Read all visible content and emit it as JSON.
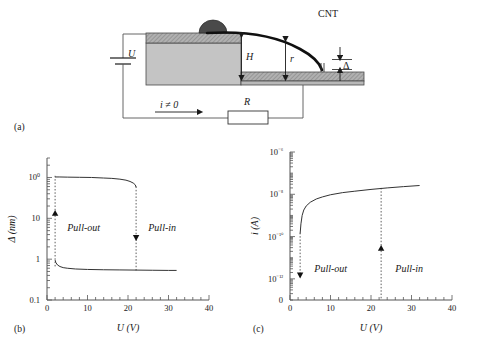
{
  "figure": {
    "panels": [
      {
        "id": "a",
        "label": "(a)"
      },
      {
        "id": "b",
        "label": "(b)"
      },
      {
        "id": "c",
        "label": "(c)"
      }
    ]
  },
  "schematic": {
    "panel_label": "(a)",
    "cnt_label": "CNT",
    "voltage_label": "U",
    "height_label": "H",
    "radius_label": "r",
    "gap_label": "Δ",
    "resistor_label": "R",
    "current_label": "i ≠ 0",
    "colors": {
      "block_body": "#c4c4c4",
      "block_top": "#a8a8a8",
      "substrate": "#b8b8b8",
      "catalyst": "#4a4a4a",
      "cnt": "#101010",
      "wire": "#555555"
    }
  },
  "chart_data": [
    {
      "type": "line",
      "panel": "b",
      "title": "",
      "xlabel": "U (V)",
      "ylabel": "Δ (nm)",
      "xlim": [
        0,
        40
      ],
      "ylim": [
        0.1,
        300
      ],
      "yscale": "log",
      "xscale": "linear",
      "xticks": [
        0,
        10,
        20,
        30,
        40
      ],
      "xticklabels": [
        "0",
        "10",
        "20",
        "30",
        "40"
      ],
      "xminor_step": 2,
      "yticks": [
        0.1,
        1,
        10,
        100
      ],
      "yticklabels": [
        "0.1",
        "1",
        "10",
        "100"
      ],
      "grid": false,
      "legend": null,
      "annotations": [
        {
          "text": "Pull-out",
          "x": 5.0,
          "y": 5.0,
          "style": "italic"
        },
        {
          "text": "Pull-in",
          "x": 25.0,
          "y": 5.0,
          "style": "italic"
        }
      ],
      "transition_lines": [
        {
          "x": 2.0,
          "y_from": 0.62,
          "y_to": 110,
          "arrow": "up",
          "arrow_y": 15,
          "name": "pull-out"
        },
        {
          "x": 22.0,
          "y_from": 60,
          "y_to": 0.5,
          "arrow": "down",
          "arrow_y": 3.0,
          "name": "pull-in"
        }
      ],
      "series": [
        {
          "name": "upper-branch",
          "comment": "separated (out) state: Δ large, from U=2 to U=22 then pull-in drop",
          "x": [
            2.0,
            3.0,
            5.0,
            8.0,
            11.0,
            14.0,
            16.0,
            18.0,
            19.5,
            20.5,
            21.3,
            21.8,
            22.0
          ],
          "y": [
            103,
            103,
            102,
            101,
            100,
            97,
            95,
            91,
            86,
            80,
            73,
            66,
            58
          ]
        },
        {
          "name": "lower-branch",
          "comment": "contacted (in) state: Δ small, from U=2 out to U=32",
          "x": [
            2.0,
            2.2,
            2.6,
            3.2,
            4.0,
            5.0,
            7.0,
            10.0,
            14.0,
            18.0,
            22.0,
            26.0,
            30.0,
            32.0
          ],
          "y": [
            0.95,
            0.82,
            0.72,
            0.66,
            0.62,
            0.6,
            0.575,
            0.56,
            0.55,
            0.545,
            0.54,
            0.535,
            0.53,
            0.53
          ]
        }
      ]
    },
    {
      "type": "line",
      "panel": "c",
      "title": "",
      "xlabel": "U (V)",
      "ylabel": "i (A)",
      "xlim": [
        0,
        40
      ],
      "ylim": [
        1e-13,
        1e-06
      ],
      "yscale": "log",
      "xscale": "linear",
      "xticks": [
        0,
        10,
        20,
        30,
        40
      ],
      "xticklabels": [
        "0",
        "10",
        "20",
        "30",
        "40"
      ],
      "xminor_step": 2,
      "yticks": [
        1e-12,
        1e-10,
        1e-08,
        1e-06
      ],
      "yticklabels": [
        "10⁻¹²",
        "10⁻¹⁰",
        "10⁻⁸",
        "10⁻⁶"
      ],
      "y_origin_label": "0",
      "x_origin_label": "0",
      "grid": false,
      "legend": null,
      "annotations": [
        {
          "text": "Pull-out",
          "x": 6.0,
          "y": 2e-12,
          "style": "italic"
        },
        {
          "text": "Pull-in",
          "x": 26.0,
          "y": 2e-12,
          "style": "italic"
        }
      ],
      "transition_lines": [
        {
          "x": 2.5,
          "y_from": 1.5e-10,
          "y_to": 1e-12,
          "arrow": "down",
          "arrow_y": 1.2e-12,
          "name": "pull-out"
        },
        {
          "x": 22.5,
          "y_from": 1e-13,
          "y_to": 2e-08,
          "arrow": "up",
          "arrow_y": 3.5e-11,
          "name": "pull-in"
        }
      ],
      "series": [
        {
          "name": "contacted-current",
          "comment": "tunneling / contact current rising with U",
          "x": [
            2.5,
            2.7,
            3.0,
            3.4,
            4.0,
            5.0,
            6.5,
            8.0,
            10.0,
            13.0,
            16.0,
            20.0,
            24.0,
            28.0,
            32.0
          ],
          "y": [
            1.4e-10,
            4e-10,
            1e-09,
            1.8e-09,
            2.8e-09,
            4.2e-09,
            6e-09,
            7.5e-09,
            9.5e-09,
            1.2e-08,
            1.4e-08,
            1.7e-08,
            2e-08,
            2.3e-08,
            2.6e-08
          ]
        }
      ]
    }
  ]
}
